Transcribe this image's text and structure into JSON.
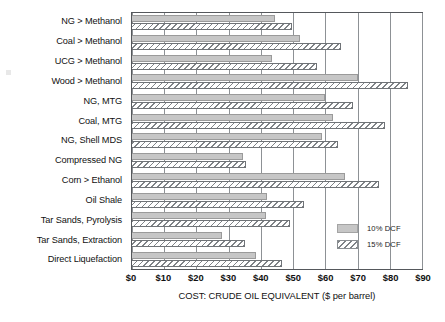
{
  "chart_data": {
    "type": "bar",
    "orientation": "horizontal",
    "title": "",
    "xlabel": "COST: CRUDE OIL EQUIVALENT ($ per barrel)",
    "ylabel": "",
    "xlim": [
      0,
      90
    ],
    "xtick_values": [
      0,
      10,
      20,
      30,
      40,
      50,
      60,
      70,
      80,
      90
    ],
    "xtick_labels": [
      "$0",
      "$10",
      "$20",
      "$30",
      "$40",
      "$50",
      "$60",
      "$70",
      "$80",
      "$90"
    ],
    "grid": "vertical",
    "legend_position": "bottom-right",
    "categories": [
      "NG > Methanol",
      "Coal > Methanol",
      "UCG > Methanol",
      "Wood > Methanol",
      "NG, MTG",
      "Coal, MTG",
      "NG, Shell MDS",
      "Compressed NG",
      "Corn > Ethanol",
      "Oil Shale",
      "Tar Sands, Pyrolysis",
      "Tar Sands, Extraction",
      "Direct Liquefaction"
    ],
    "series": [
      {
        "name": "10% DCF",
        "style": "solid-gray",
        "color": "#c6c6c6",
        "values": [
          44.5,
          52,
          43.5,
          70,
          60,
          62.5,
          59,
          34.5,
          66,
          42,
          41.5,
          28,
          38.5
        ]
      },
      {
        "name": "15% DCF",
        "style": "diagonal-hatch",
        "color": "#ffffff",
        "values": [
          49.5,
          65,
          57.5,
          85.5,
          68.5,
          78.5,
          64,
          35.5,
          76.5,
          53.5,
          49,
          35,
          46.5
        ]
      }
    ]
  },
  "legend": {
    "entries": [
      {
        "label": "10% DCF"
      },
      {
        "label": "15% DCF"
      }
    ]
  }
}
